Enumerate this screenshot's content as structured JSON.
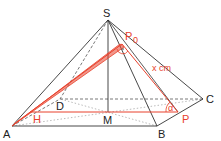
{
  "diagram": {
    "type": "pyramid",
    "colors": {
      "edge": "#333333",
      "hidden_edge": "#555555",
      "dotted_base": "#aaaaaa",
      "accent": "#e8412c"
    },
    "points": {
      "S": {
        "label": "S",
        "x": 108,
        "y": 20
      },
      "A": {
        "label": "A",
        "x": 12,
        "y": 126
      },
      "B": {
        "label": "B",
        "x": 157,
        "y": 126
      },
      "C": {
        "label": "C",
        "x": 203,
        "y": 99
      },
      "D": {
        "label": "D",
        "x": 60,
        "y": 99
      },
      "M": {
        "label": "M",
        "x": 108,
        "y": 112
      },
      "H": {
        "label": "H",
        "x": 30,
        "y": 112
      },
      "P": {
        "label": "P",
        "x": 178,
        "y": 112
      },
      "P0": {
        "label": "P",
        "subscript": "0",
        "x": 122,
        "y": 44
      }
    },
    "annotations": {
      "length": "x cm",
      "angle": "α",
      "right_angle_mark": "·"
    }
  }
}
